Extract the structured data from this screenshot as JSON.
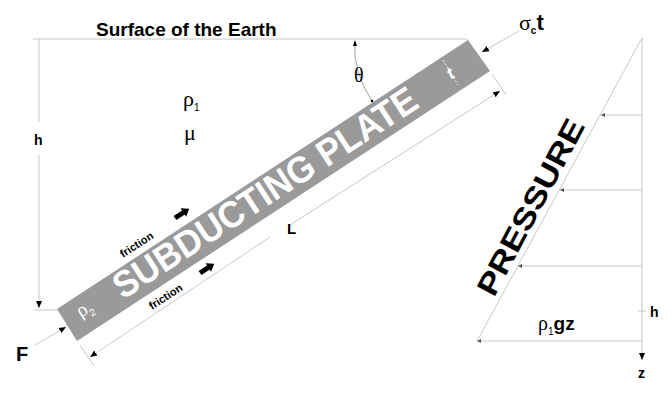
{
  "title": "Surface of the Earth",
  "plate": {
    "label": "SUBDUCTING PLATE",
    "fill": "#9a9a9a",
    "density_symbol": "ρ",
    "density_sub": "2",
    "thickness_label": "t",
    "length_label": "L"
  },
  "mantle": {
    "density_symbol": "ρ",
    "density_sub": "1",
    "viscosity_symbol": "μ"
  },
  "labels": {
    "depth": "h",
    "angle": "θ",
    "force": "F",
    "stress_sigma": "σ",
    "stress_sub": "c",
    "stress_t": "t",
    "friction_top": "friction",
    "friction_bottom": "friction"
  },
  "pressure": {
    "label": "PRESSURE",
    "formula_rho": "ρ",
    "formula_sub": "1",
    "formula_rest": "gz",
    "depth_label": "h",
    "axis_label": "z"
  },
  "colors": {
    "line": "#c8c8c8",
    "text": "#000000",
    "plate_text": "#ffffff"
  }
}
